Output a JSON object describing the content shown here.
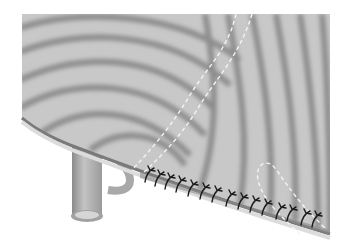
{
  "figure": {
    "type": "anatomical-surgical-illustration",
    "colors": {
      "background": "#ffffff",
      "tissue_base": "#c8c8c8",
      "tissue_ridge": "#8e8e8e",
      "rim_light": "#dcdcdc",
      "rim_dark": "#7a7a7a",
      "suture": "#1a1a1a",
      "dashed_outline": "#f4f4f4",
      "tube": "#b4b4b4"
    },
    "elements": {
      "suture_count": 22,
      "dashed_paths": 3,
      "tube_count": 1
    }
  }
}
